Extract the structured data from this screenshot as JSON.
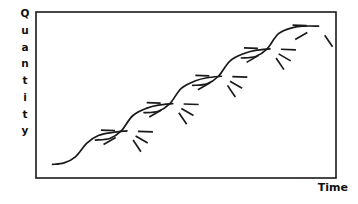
{
  "figure": {
    "title": "",
    "background_color": "#ffffff",
    "ink_color": "#1a1a1a"
  },
  "axes": {
    "y_label": "Quantity",
    "y_label_letters": [
      "Q",
      "u",
      "a",
      "n",
      "t",
      "i",
      "t",
      "y"
    ],
    "x_label": "Time",
    "frame": {
      "x": 36,
      "y": 12,
      "width": 300,
      "height": 166
    },
    "ticks": [],
    "gridlines": false
  },
  "chart_data": {
    "type": "line",
    "title": "",
    "xlabel": "Time",
    "ylabel": "Quantity",
    "xlim": [
      0,
      100
    ],
    "ylim": [
      0,
      100
    ],
    "grid": false,
    "legend": null,
    "annotation": "Five overlapping sigmoid (S) curves ascending from lower-left to upper-right; each curve plateau emits a fan of three short dashes",
    "series": [
      {
        "name": "s-curve-1",
        "type": "sigmoid",
        "x_start": 3,
        "x_end": 29,
        "y_start": 5,
        "y_end": 27,
        "points": [
          [
            3,
            5
          ],
          [
            7,
            6
          ],
          [
            11,
            10
          ],
          [
            15,
            19
          ],
          [
            19,
            24
          ],
          [
            24,
            26
          ],
          [
            29,
            27
          ]
        ]
      },
      {
        "name": "s-curve-2",
        "type": "sigmoid",
        "x_start": 18,
        "x_end": 45,
        "y_start": 21,
        "y_end": 45,
        "points": [
          [
            18,
            21
          ],
          [
            23,
            22
          ],
          [
            27,
            27
          ],
          [
            31,
            37
          ],
          [
            36,
            42
          ],
          [
            40,
            44
          ],
          [
            45,
            45
          ]
        ]
      },
      {
        "name": "s-curve-3",
        "type": "sigmoid",
        "x_start": 35,
        "x_end": 62,
        "y_start": 39,
        "y_end": 63,
        "points": [
          [
            35,
            39
          ],
          [
            40,
            40
          ],
          [
            44,
            45
          ],
          [
            48,
            55
          ],
          [
            53,
            60
          ],
          [
            57,
            62
          ],
          [
            62,
            63
          ]
        ]
      },
      {
        "name": "s-curve-4",
        "type": "sigmoid",
        "x_start": 52,
        "x_end": 79,
        "y_start": 57,
        "y_end": 81,
        "points": [
          [
            52,
            57
          ],
          [
            57,
            58
          ],
          [
            61,
            63
          ],
          [
            65,
            73
          ],
          [
            70,
            78
          ],
          [
            74,
            80
          ],
          [
            79,
            81
          ]
        ]
      },
      {
        "name": "s-curve-5",
        "type": "sigmoid",
        "x_start": 69,
        "x_end": 96,
        "y_start": 75,
        "y_end": 96,
        "points": [
          [
            69,
            75
          ],
          [
            74,
            76
          ],
          [
            78,
            81
          ],
          [
            82,
            91
          ],
          [
            87,
            95
          ],
          [
            91,
            96
          ],
          [
            96,
            96
          ]
        ]
      }
    ],
    "spray_groups": [
      {
        "origin": [
          29,
          27
        ],
        "dashes": [
          [
            0,
            "horizontal"
          ],
          [
            -30,
            "down-right"
          ],
          [
            -55,
            "down-right-steep"
          ]
        ]
      },
      {
        "origin": [
          45,
          45
        ],
        "dashes": [
          [
            0,
            "horizontal"
          ],
          [
            -30,
            "down-right"
          ],
          [
            -55,
            "down-right-steep"
          ]
        ]
      },
      {
        "origin": [
          62,
          63
        ],
        "dashes": [
          [
            0,
            "horizontal"
          ],
          [
            -30,
            "down-right"
          ],
          [
            -55,
            "down-right-steep"
          ]
        ]
      },
      {
        "origin": [
          79,
          81
        ],
        "dashes": [
          [
            0,
            "horizontal"
          ],
          [
            -30,
            "down-right"
          ],
          [
            -55,
            "down-right-steep"
          ]
        ]
      },
      {
        "origin": [
          96,
          96
        ],
        "dashes": [
          [
            0,
            "horizontal"
          ],
          [
            -30,
            "down-right"
          ],
          [
            -55,
            "down-right-steep"
          ]
        ]
      }
    ]
  }
}
